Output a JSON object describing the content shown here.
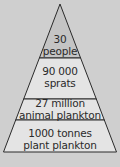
{
  "diagram": {
    "type": "food-pyramid",
    "colors": {
      "background": "#cfcfcf",
      "top_level_fill": "#c4c4c4",
      "level_fill": "#e4e4e4",
      "outline": "#2a2a2a"
    },
    "levels": [
      {
        "line1": "30",
        "line2": "people"
      },
      {
        "line1": "90 000",
        "line2": "sprats"
      },
      {
        "line1": "27 million",
        "line2": "animal plankton"
      },
      {
        "line1": "1000 tonnes",
        "line2": "plant plankton"
      }
    ]
  }
}
